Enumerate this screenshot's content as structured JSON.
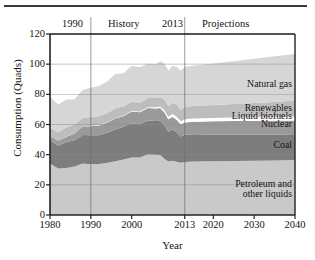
{
  "figure": {
    "has_top_rule": true,
    "header_annotations": [
      {
        "name": "year-1990",
        "text": "1990"
      },
      {
        "name": "history",
        "text": "History"
      },
      {
        "name": "year-2013",
        "text": "2013"
      },
      {
        "name": "projections",
        "text": "Projections"
      }
    ]
  },
  "chart_data": {
    "type": "area",
    "title": "",
    "subtitle": "",
    "xlabel": "Year",
    "ylabel": "Consumption (Quads)",
    "xlim": [
      1980,
      2040
    ],
    "ylim": [
      0,
      120
    ],
    "xticks": [
      1980,
      1990,
      2000,
      2013,
      2020,
      2030,
      2040
    ],
    "xtick_labels": [
      "1980",
      "1990",
      "2000",
      "2013",
      "2020",
      "2030",
      "2040"
    ],
    "yticks": [
      0,
      20,
      40,
      60,
      80,
      100,
      120
    ],
    "ytick_labels": [
      "0",
      "20",
      "40",
      "60",
      "80",
      "100",
      "120"
    ],
    "grid": true,
    "gridlines_x": [
      1990,
      2013
    ],
    "legend_position": "inline-right",
    "stacked": true,
    "history_end": 2013,
    "annotations": [
      {
        "name": "natural-gas-label",
        "text": "Natural gas",
        "x": 2030,
        "y": 86
      },
      {
        "name": "renewables-label",
        "text": "Renewables",
        "x": 2030,
        "y": 70
      },
      {
        "name": "liquid-biofuels-label",
        "text": "Liquid biofuels",
        "x": 2030,
        "y": 65
      },
      {
        "name": "nuclear-label",
        "text": "Nuclear",
        "x": 2030,
        "y": 60
      },
      {
        "name": "coal-label",
        "text": "Coal",
        "x": 2030,
        "y": 46
      },
      {
        "name": "petroleum-label",
        "text": "Petroleum and\nother liquids",
        "x": 2030,
        "y": 20
      }
    ],
    "x": [
      1980,
      1982,
      1984,
      1986,
      1988,
      1990,
      1992,
      1994,
      1996,
      1998,
      2000,
      2002,
      2004,
      2006,
      2007,
      2008,
      2009,
      2010,
      2011,
      2012,
      2013,
      2015,
      2020,
      2025,
      2030,
      2035,
      2040
    ],
    "series": [
      {
        "name": "Petroleum and other liquids",
        "color": "#c9c9c9",
        "values": [
          34.2,
          30.8,
          31.2,
          32.2,
          34.2,
          33.6,
          33.8,
          34.6,
          35.7,
          36.8,
          38.2,
          38.2,
          40.2,
          40.0,
          39.8,
          37.3,
          35.4,
          36.0,
          35.3,
          34.7,
          35.1,
          35.4,
          35.6,
          35.8,
          36.0,
          36.2,
          36.5
        ]
      },
      {
        "name": "Coal",
        "color": "#7d7d7d",
        "values": [
          15.4,
          15.3,
          17.1,
          17.3,
          18.8,
          19.2,
          19.1,
          19.9,
          21.0,
          21.7,
          22.6,
          21.9,
          22.5,
          22.4,
          22.7,
          22.4,
          19.7,
          20.8,
          19.6,
          17.4,
          18.0,
          18.1,
          17.8,
          17.6,
          17.4,
          17.2,
          17.0
        ]
      },
      {
        "name": "Nuclear",
        "color": "#9a9a9a",
        "values": [
          2.7,
          3.1,
          3.6,
          4.5,
          5.6,
          6.1,
          6.5,
          6.8,
          7.2,
          7.2,
          7.9,
          8.1,
          8.2,
          8.2,
          8.4,
          8.4,
          8.3,
          8.4,
          8.3,
          8.1,
          8.3,
          8.4,
          8.7,
          8.9,
          9.0,
          9.1,
          9.2
        ]
      },
      {
        "name": "Liquid biofuels",
        "color": "#ffffff",
        "values": [
          0.0,
          0.1,
          0.1,
          0.1,
          0.1,
          0.1,
          0.2,
          0.2,
          0.2,
          0.2,
          0.3,
          0.4,
          0.6,
          0.8,
          1.0,
          1.4,
          1.5,
          1.8,
          1.9,
          1.9,
          2.0,
          2.1,
          2.2,
          2.3,
          2.4,
          2.5,
          2.6
        ]
      },
      {
        "name": "Renewables",
        "color": "#bdbdbd",
        "values": [
          5.5,
          5.5,
          6.1,
          6.0,
          5.6,
          6.0,
          5.9,
          6.0,
          6.7,
          6.1,
          6.1,
          5.8,
          6.1,
          6.4,
          6.4,
          7.1,
          7.3,
          7.4,
          8.3,
          7.7,
          8.1,
          8.2,
          8.6,
          9.0,
          9.5,
          10.0,
          10.6
        ]
      },
      {
        "name": "Natural gas",
        "color": "#d6d6d6",
        "values": [
          20.4,
          18.4,
          18.4,
          16.7,
          18.6,
          19.3,
          20.1,
          21.0,
          22.6,
          21.9,
          23.8,
          23.5,
          22.9,
          22.2,
          23.6,
          23.8,
          23.4,
          24.6,
          24.9,
          26.0,
          26.6,
          26.8,
          27.5,
          28.4,
          29.3,
          30.2,
          30.8
        ]
      }
    ]
  }
}
